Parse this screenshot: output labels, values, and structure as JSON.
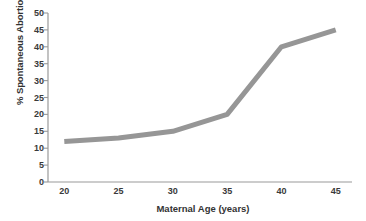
{
  "chart_data": {
    "type": "line",
    "title": "",
    "subtitle": "",
    "xlabel": "Maternal Age (years)",
    "ylabel": "% Spontaneous Abortion",
    "x": [
      20,
      25,
      30,
      35,
      40,
      45
    ],
    "values": [
      12,
      13,
      15,
      20,
      40,
      45
    ],
    "series": [
      {
        "name": "% Spontaneous Abortion",
        "values": [
          12,
          13,
          15,
          20,
          40,
          45
        ],
        "color": "#969696"
      }
    ],
    "xlim": [
      18.5,
      46.5
    ],
    "ylim": [
      0,
      50
    ],
    "xticks": [
      20,
      25,
      30,
      35,
      40,
      45
    ],
    "xtick_labels": [
      "20",
      "25",
      "30",
      "35",
      "40",
      "45"
    ],
    "yticks": [
      0,
      5,
      10,
      15,
      20,
      25,
      30,
      35,
      40,
      45,
      50
    ],
    "ytick_labels": [
      "0",
      "5",
      "10",
      "15",
      "20",
      "25",
      "30",
      "35",
      "40",
      "45",
      "50"
    ],
    "grid": false,
    "legend": false,
    "legend_position": "none",
    "line_color": "#969696",
    "line_width": 5,
    "markers": false,
    "axis_color": "#9a9a9a",
    "tick_label_color": "#3a3a3a",
    "background_color": "#ffffff",
    "spines": {
      "left": true,
      "bottom": true,
      "top": false,
      "right": false
    }
  }
}
